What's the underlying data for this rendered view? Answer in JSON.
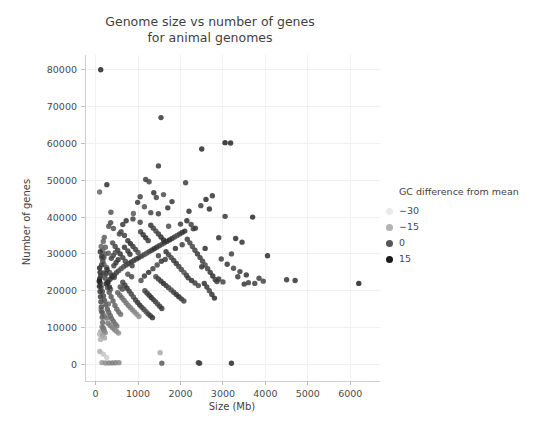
{
  "chart_data": {
    "type": "scatter",
    "title": "Genome size vs number of genes\nfor animal genomes",
    "xlabel": "Size (Mb)",
    "ylabel": "Number of genes",
    "xlim": [
      -250,
      6700
    ],
    "ylim": [
      -4500,
      84000
    ],
    "xticks": [
      0,
      1000,
      2000,
      3000,
      4000,
      5000,
      6000
    ],
    "xtick_labels": [
      "0",
      "1000",
      "2000",
      "3000",
      "4000",
      "5000",
      "6000"
    ],
    "yticks": [
      0,
      10000,
      20000,
      30000,
      40000,
      50000,
      60000,
      70000,
      80000
    ],
    "ytick_labels": [
      "0",
      "10000",
      "20000",
      "30000",
      "40000",
      "50000",
      "60000",
      "70000",
      "80000"
    ],
    "grid": true,
    "grid_color": "#f0f0f0",
    "background": "#ffffff",
    "point_size": 5.4,
    "point_opacity": 0.85,
    "colorbar_legend": {
      "title": "GC difference from mean",
      "position": "right",
      "entries": [
        {
          "label": "-30",
          "color": "#e9e9e9",
          "value": -30
        },
        {
          "label": "-15",
          "color": "#b3b3b3",
          "value": -15
        },
        {
          "label": "0",
          "color": "#555555",
          "value": 0
        },
        {
          "label": "15",
          "color": "#1c1c1c",
          "value": 15
        }
      ]
    },
    "color_scale": {
      "variable": "GC difference from mean",
      "domain": [
        -30,
        15
      ],
      "range": [
        "#e9e9e9",
        "#111111"
      ]
    },
    "points": [
      [
        120,
        80000,
        10
      ],
      [
        95,
        46800,
        -5
      ],
      [
        265,
        48800,
        8
      ],
      [
        1540,
        67000,
        6
      ],
      [
        1180,
        50200,
        4
      ],
      [
        1260,
        49600,
        2
      ],
      [
        1480,
        53900,
        5
      ],
      [
        1370,
        46600,
        7
      ],
      [
        1430,
        45300,
        3
      ],
      [
        2500,
        58500,
        9
      ],
      [
        3050,
        60200,
        11
      ],
      [
        3180,
        60100,
        10
      ],
      [
        1600,
        46100,
        1
      ],
      [
        1800,
        44200,
        6
      ],
      [
        2120,
        49300,
        4
      ],
      [
        1150,
        42800,
        0
      ],
      [
        1300,
        41200,
        3
      ],
      [
        2200,
        41600,
        7
      ],
      [
        2480,
        43100,
        5
      ],
      [
        2680,
        42200,
        8
      ],
      [
        3050,
        40200,
        6
      ],
      [
        890,
        41000,
        -2
      ],
      [
        1050,
        38600,
        2
      ],
      [
        1480,
        40900,
        4
      ],
      [
        1720,
        37500,
        1
      ],
      [
        2000,
        38100,
        5
      ],
      [
        2300,
        36800,
        3
      ],
      [
        360,
        41300,
        -1
      ],
      [
        420,
        36900,
        0
      ],
      [
        560,
        35400,
        2
      ],
      [
        180,
        33400,
        -4
      ],
      [
        230,
        31800,
        -3
      ],
      [
        300,
        30200,
        -2
      ],
      [
        150,
        28900,
        -6
      ],
      [
        200,
        27100,
        -5
      ],
      [
        260,
        26300,
        -4
      ],
      [
        330,
        25000,
        -1
      ],
      [
        380,
        24200,
        0
      ],
      [
        440,
        23600,
        1
      ],
      [
        95,
        23200,
        9
      ],
      [
        110,
        22100,
        5
      ],
      [
        130,
        21000,
        3
      ],
      [
        160,
        19800,
        2
      ],
      [
        185,
        18600,
        1
      ],
      [
        210,
        17400,
        0
      ],
      [
        240,
        16200,
        -1
      ],
      [
        275,
        15000,
        -2
      ],
      [
        310,
        14100,
        -3
      ],
      [
        345,
        13200,
        -4
      ],
      [
        380,
        12400,
        -5
      ],
      [
        420,
        11700,
        -6
      ],
      [
        460,
        11000,
        -7
      ],
      [
        500,
        10400,
        -8
      ],
      [
        150,
        10200,
        -12
      ],
      [
        190,
        9600,
        -14
      ],
      [
        120,
        8900,
        -18
      ],
      [
        95,
        8200,
        -22
      ],
      [
        130,
        14800,
        -10
      ],
      [
        170,
        13900,
        -9
      ],
      [
        205,
        13100,
        -8
      ],
      [
        250,
        21800,
        4
      ],
      [
        290,
        22400,
        6
      ],
      [
        340,
        23100,
        7
      ],
      [
        390,
        23800,
        8
      ],
      [
        440,
        24300,
        5
      ],
      [
        490,
        24900,
        3
      ],
      [
        540,
        25400,
        2
      ],
      [
        600,
        26000,
        1
      ],
      [
        660,
        26500,
        0
      ],
      [
        720,
        27000,
        2
      ],
      [
        780,
        27400,
        4
      ],
      [
        840,
        27800,
        6
      ],
      [
        900,
        28200,
        3
      ],
      [
        960,
        28600,
        5
      ],
      [
        1020,
        29000,
        7
      ],
      [
        1080,
        29400,
        4
      ],
      [
        1140,
        29800,
        2
      ],
      [
        1200,
        30200,
        0
      ],
      [
        1260,
        30600,
        3
      ],
      [
        1320,
        31000,
        5
      ],
      [
        1380,
        31400,
        8
      ],
      [
        1440,
        31800,
        6
      ],
      [
        1500,
        32200,
        4
      ],
      [
        1560,
        32600,
        2
      ],
      [
        1620,
        33000,
        5
      ],
      [
        1680,
        33400,
        7
      ],
      [
        1740,
        33800,
        9
      ],
      [
        1800,
        34200,
        6
      ],
      [
        1860,
        34600,
        3
      ],
      [
        1920,
        35000,
        1
      ],
      [
        1980,
        35400,
        4
      ],
      [
        2040,
        35800,
        6
      ],
      [
        2100,
        36200,
        8
      ],
      [
        2160,
        34000,
        5
      ],
      [
        2220,
        33000,
        3
      ],
      [
        2280,
        32000,
        2
      ],
      [
        2340,
        31000,
        4
      ],
      [
        2400,
        30000,
        6
      ],
      [
        2460,
        29000,
        5
      ],
      [
        2520,
        28000,
        3
      ],
      [
        2580,
        27000,
        1
      ],
      [
        2640,
        26000,
        4
      ],
      [
        2700,
        25000,
        6
      ],
      [
        2760,
        24000,
        8
      ],
      [
        2820,
        23000,
        5
      ],
      [
        2900,
        34400,
        7
      ],
      [
        2960,
        28600,
        4
      ],
      [
        3100,
        27200,
        6
      ],
      [
        3250,
        26100,
        3
      ],
      [
        3400,
        25200,
        5
      ],
      [
        3550,
        24300,
        7
      ],
      [
        3700,
        40000,
        9
      ],
      [
        3850,
        23400,
        4
      ],
      [
        3950,
        22600,
        2
      ],
      [
        4050,
        29500,
        8
      ],
      [
        4500,
        23000,
        6
      ],
      [
        4700,
        22800,
        7
      ],
      [
        6200,
        22000,
        11
      ],
      [
        3200,
        30000,
        4
      ],
      [
        100,
        3500,
        -20
      ],
      [
        180,
        2800,
        -24
      ],
      [
        260,
        1900,
        -26
      ],
      [
        150,
        500,
        -16
      ],
      [
        230,
        400,
        -14
      ],
      [
        310,
        380,
        -12
      ],
      [
        390,
        420,
        -10
      ],
      [
        470,
        450,
        -11
      ],
      [
        550,
        480,
        -13
      ],
      [
        1520,
        3200,
        -19
      ],
      [
        1560,
        350,
        -2
      ],
      [
        2450,
        330,
        6
      ],
      [
        3200,
        320,
        9
      ],
      [
        2420,
        480,
        4
      ],
      [
        85,
        22600,
        12
      ],
      [
        90,
        21200,
        8
      ],
      [
        105,
        19800,
        6
      ],
      [
        115,
        18400,
        4
      ],
      [
        125,
        17000,
        2
      ],
      [
        135,
        15600,
        0
      ],
      [
        145,
        14200,
        -2
      ],
      [
        155,
        12800,
        -4
      ],
      [
        165,
        11400,
        -6
      ],
      [
        175,
        10000,
        -8
      ],
      [
        200,
        9200,
        -10
      ],
      [
        225,
        8600,
        -12
      ],
      [
        250,
        22000,
        2
      ],
      [
        280,
        20800,
        0
      ],
      [
        320,
        19600,
        -1
      ],
      [
        365,
        18400,
        -2
      ],
      [
        410,
        17200,
        -3
      ],
      [
        455,
        16000,
        -4
      ],
      [
        500,
        15000,
        -5
      ],
      [
        545,
        14200,
        -6
      ],
      [
        590,
        13600,
        -7
      ],
      [
        640,
        22300,
        3
      ],
      [
        690,
        21500,
        5
      ],
      [
        740,
        20700,
        7
      ],
      [
        790,
        19900,
        4
      ],
      [
        840,
        19100,
        2
      ],
      [
        890,
        18300,
        0
      ],
      [
        940,
        17500,
        3
      ],
      [
        990,
        16800,
        5
      ],
      [
        1040,
        16100,
        7
      ],
      [
        1090,
        15500,
        4
      ],
      [
        1140,
        14900,
        2
      ],
      [
        1190,
        14300,
        0
      ],
      [
        1240,
        13700,
        3
      ],
      [
        1290,
        13200,
        5
      ],
      [
        1340,
        12700,
        7
      ],
      [
        400,
        33000,
        1
      ],
      [
        460,
        32000,
        3
      ],
      [
        520,
        31000,
        5
      ],
      [
        580,
        30000,
        7
      ],
      [
        640,
        29000,
        4
      ],
      [
        700,
        28000,
        2
      ],
      [
        760,
        33600,
        6
      ],
      [
        820,
        32800,
        8
      ],
      [
        880,
        32000,
        5
      ],
      [
        940,
        31200,
        3
      ],
      [
        1000,
        30400,
        1
      ],
      [
        1060,
        36000,
        4
      ],
      [
        1120,
        35200,
        6
      ],
      [
        1180,
        34400,
        8
      ],
      [
        1240,
        33600,
        5
      ],
      [
        1300,
        37800,
        7
      ],
      [
        1360,
        37000,
        4
      ],
      [
        1420,
        36200,
        2
      ],
      [
        1480,
        35400,
        5
      ],
      [
        1540,
        34600,
        7
      ],
      [
        1600,
        33800,
        9
      ],
      [
        1660,
        30600,
        6
      ],
      [
        1720,
        29800,
        4
      ],
      [
        1780,
        29000,
        2
      ],
      [
        1840,
        28200,
        5
      ],
      [
        1900,
        27400,
        7
      ],
      [
        1960,
        26600,
        4
      ],
      [
        2020,
        25800,
        2
      ],
      [
        2080,
        25000,
        0
      ],
      [
        2140,
        24200,
        3
      ],
      [
        290,
        11200,
        -9
      ],
      [
        340,
        10600,
        -10
      ],
      [
        390,
        10000,
        -11
      ],
      [
        440,
        9500,
        -12
      ],
      [
        490,
        9000,
        -13
      ],
      [
        540,
        8500,
        -14
      ],
      [
        160,
        7800,
        -17
      ],
      [
        210,
        7200,
        -19
      ],
      [
        115,
        6800,
        -21
      ],
      [
        1420,
        23800,
        2
      ],
      [
        1480,
        23200,
        4
      ],
      [
        1540,
        22600,
        6
      ],
      [
        1600,
        22000,
        8
      ],
      [
        1660,
        21400,
        5
      ],
      [
        1720,
        20800,
        3
      ],
      [
        1780,
        20200,
        1
      ],
      [
        1840,
        19600,
        4
      ],
      [
        1900,
        19000,
        6
      ],
      [
        1960,
        18400,
        8
      ],
      [
        2020,
        17800,
        5
      ],
      [
        2080,
        17200,
        3
      ],
      [
        2560,
        22000,
        7
      ],
      [
        2620,
        21000,
        5
      ],
      [
        2680,
        20000,
        3
      ],
      [
        2740,
        19000,
        6
      ],
      [
        2800,
        18000,
        8
      ],
      [
        2860,
        22500,
        4
      ],
      [
        95,
        26200,
        10
      ],
      [
        105,
        25000,
        8
      ],
      [
        120,
        24000,
        6
      ],
      [
        140,
        27000,
        4
      ],
      [
        170,
        28000,
        2
      ],
      [
        195,
        29000,
        0
      ],
      [
        220,
        30000,
        -2
      ],
      [
        245,
        24600,
        5
      ],
      [
        270,
        25800,
        7
      ],
      [
        2350,
        37000,
        6
      ],
      [
        2250,
        38000,
        4
      ],
      [
        2150,
        39000,
        8
      ],
      [
        1050,
        45500,
        3
      ],
      [
        990,
        44000,
        5
      ],
      [
        1700,
        42500,
        7
      ],
      [
        2600,
        44800,
        9
      ],
      [
        2750,
        45800,
        6
      ],
      [
        600,
        36000,
        2
      ],
      [
        680,
        35000,
        4
      ],
      [
        760,
        24500,
        0
      ],
      [
        850,
        23800,
        2
      ],
      [
        1150,
        24000,
        5
      ],
      [
        1250,
        25000,
        7
      ],
      [
        1350,
        26000,
        4
      ],
      [
        1450,
        27000,
        2
      ],
      [
        1550,
        28000,
        6
      ],
      [
        2900,
        23200,
        5
      ],
      [
        3000,
        22400,
        3
      ],
      [
        3300,
        34200,
        8
      ],
      [
        3500,
        21800,
        6
      ],
      [
        3600,
        22200,
        4
      ],
      [
        130,
        32000,
        -5
      ],
      [
        165,
        31000,
        -6
      ],
      [
        205,
        34500,
        -3
      ],
      [
        310,
        37500,
        0
      ],
      [
        355,
        38500,
        2
      ],
      [
        640,
        38000,
        5
      ],
      [
        720,
        39000,
        7
      ],
      [
        880,
        39500,
        4
      ],
      [
        1480,
        29500,
        3
      ],
      [
        1640,
        28500,
        5
      ],
      [
        1880,
        31500,
        7
      ],
      [
        2040,
        32500,
        4
      ],
      [
        520,
        19500,
        -4
      ],
      [
        570,
        18800,
        -5
      ],
      [
        620,
        18100,
        -6
      ],
      [
        670,
        17400,
        -7
      ],
      [
        720,
        16700,
        -8
      ],
      [
        770,
        16000,
        -9
      ],
      [
        820,
        15400,
        -10
      ],
      [
        870,
        14800,
        -11
      ],
      [
        920,
        14200,
        -12
      ],
      [
        970,
        13600,
        -13
      ],
      [
        1020,
        13000,
        -14
      ],
      [
        1070,
        22800,
        1
      ],
      [
        260,
        12600,
        -8
      ],
      [
        300,
        16400,
        -6
      ],
      [
        350,
        20400,
        -3
      ],
      [
        430,
        26800,
        3
      ],
      [
        480,
        27600,
        5
      ],
      [
        530,
        28400,
        7
      ],
      [
        580,
        21000,
        0
      ],
      [
        630,
        20400,
        -1
      ],
      [
        680,
        31800,
        6
      ],
      [
        1160,
        20000,
        2
      ],
      [
        1210,
        19400,
        4
      ],
      [
        1260,
        18800,
        6
      ],
      [
        1310,
        18200,
        8
      ],
      [
        1360,
        17600,
        5
      ],
      [
        1410,
        17000,
        3
      ],
      [
        1460,
        16400,
        1
      ],
      [
        1510,
        15800,
        4
      ],
      [
        1560,
        15200,
        6
      ],
      [
        2180,
        23500,
        5
      ],
      [
        2260,
        22800,
        7
      ],
      [
        2340,
        22100,
        4
      ],
      [
        2420,
        21400,
        2
      ],
      [
        2500,
        26500,
        6
      ],
      [
        2580,
        31500,
        8
      ],
      [
        3350,
        23800,
        5
      ],
      [
        3450,
        33200,
        7
      ],
      [
        3750,
        22000,
        4
      ],
      [
        110,
        30600,
        7
      ],
      [
        145,
        29400,
        5
      ],
      [
        185,
        24800,
        3
      ],
      [
        225,
        23400,
        1
      ],
      [
        285,
        22200,
        8
      ],
      [
        325,
        21000,
        6
      ],
      [
        370,
        28800,
        4
      ],
      [
        415,
        29600,
        2
      ],
      [
        465,
        30400,
        0
      ],
      [
        760,
        30800,
        5
      ],
      [
        810,
        29900,
        7
      ],
      [
        860,
        26800,
        3
      ]
    ]
  }
}
